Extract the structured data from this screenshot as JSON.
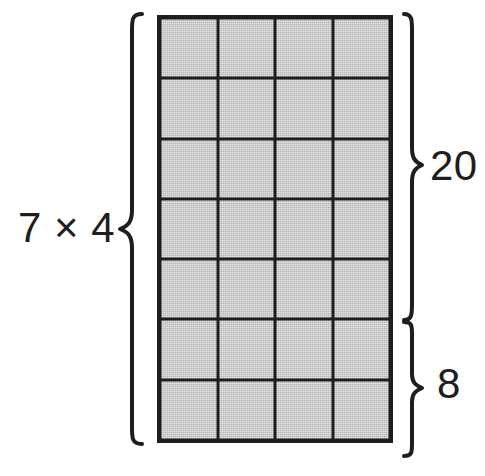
{
  "diagram": {
    "type": "array-model-multiplication",
    "background_color": "#ffffff",
    "line_color": "#1e1e1e",
    "cell_fill_color": "#c9c9c9"
  },
  "grid": {
    "rows": 7,
    "columns": 4,
    "total_cells": 28,
    "cells": [
      [
        "cell",
        "cell",
        "cell",
        "cell"
      ],
      [
        "cell",
        "cell",
        "cell",
        "cell"
      ],
      [
        "cell",
        "cell",
        "cell",
        "cell"
      ],
      [
        "cell",
        "cell",
        "cell",
        "cell"
      ],
      [
        "cell",
        "cell",
        "cell",
        "cell"
      ],
      [
        "cell",
        "cell",
        "cell",
        "cell"
      ],
      [
        "cell",
        "cell",
        "cell",
        "cell"
      ]
    ]
  },
  "labels": {
    "factors": "7 × 4",
    "partition_upper": "20",
    "partition_lower": "8"
  },
  "braces": {
    "left": {
      "name": "left-brace",
      "orientation": "opening-left",
      "spans_rows": 7,
      "label": "7 × 4"
    },
    "right_upper": {
      "name": "right-brace-upper",
      "orientation": "closing-right",
      "spans_rows": 5,
      "label": "20"
    },
    "right_lower": {
      "name": "right-brace-lower",
      "orientation": "closing-right",
      "spans_rows": 2,
      "label": "8"
    }
  }
}
